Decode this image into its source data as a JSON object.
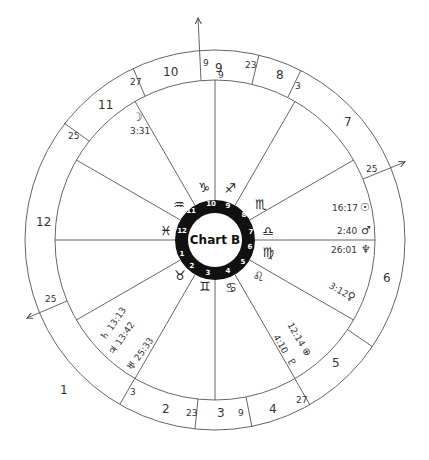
{
  "chart": {
    "title": "Chart B",
    "center": [
      215,
      240
    ],
    "radii": {
      "outer": 190,
      "house_ring": 160,
      "wheel_outer": 40,
      "wheel_inner": 27
    },
    "colors": {
      "line": "#555555",
      "wheel": "#111111",
      "text": "#333333"
    },
    "angles": {
      "ascendant": {
        "label": "25",
        "arrow": true
      },
      "descendant": {
        "label": "25",
        "arrow": true
      },
      "midheaven": {
        "label": "9",
        "arrow": true
      }
    },
    "houses": [
      {
        "number": "1",
        "cusp_degree": "25"
      },
      {
        "number": "2",
        "cusp_degree": "3"
      },
      {
        "number": "3",
        "cusp_degree": "23"
      },
      {
        "number": "4",
        "cusp_degree": "9"
      },
      {
        "number": "5",
        "cusp_degree": "27"
      },
      {
        "number": "6",
        "cusp_degree": ""
      },
      {
        "number": "7",
        "cusp_degree": "25"
      },
      {
        "number": "8",
        "cusp_degree": "3"
      },
      {
        "number": "9",
        "cusp_degree": "23"
      },
      {
        "number": "10",
        "cusp_degree": "9"
      },
      {
        "number": "11",
        "cusp_degree": "27"
      },
      {
        "number": "12",
        "cusp_degree": "25"
      }
    ],
    "cusp_labels": [
      "9",
      "9",
      "23",
      "3",
      "25",
      "27",
      "9",
      "23",
      "3",
      "25",
      "25",
      "27"
    ],
    "signs": [
      "♈",
      "♉",
      "♊",
      "♋",
      "♌",
      "♍",
      "♎",
      "♏",
      "♐",
      "♑",
      "♒",
      "♓"
    ],
    "wheel_numbers": [
      "1",
      "2",
      "3",
      "4",
      "5",
      "6",
      "7",
      "8",
      "9",
      "10",
      "11",
      "12"
    ],
    "planets": [
      {
        "symbol": "☽",
        "name": "Moon",
        "position": "3:31"
      },
      {
        "symbol": "☉",
        "name": "Sun",
        "position": "16:17"
      },
      {
        "symbol": "♂",
        "name": "Mars",
        "position": "2:40"
      },
      {
        "symbol": "♆",
        "name": "Neptune",
        "position": "26:01"
      },
      {
        "symbol": "♀",
        "name": "Venus",
        "position": "3:12"
      },
      {
        "symbol": "⊕",
        "name": "Part of Fortune",
        "position": "12:14"
      },
      {
        "symbol": "♇",
        "name": "Pluto",
        "position": "4:10"
      },
      {
        "symbol": "♄",
        "name": "Saturn",
        "position": "13:13"
      },
      {
        "symbol": "♃",
        "name": "Jupiter",
        "position": "13:42"
      },
      {
        "symbol": "♅",
        "name": "Uranus",
        "position": "25:33"
      }
    ]
  }
}
